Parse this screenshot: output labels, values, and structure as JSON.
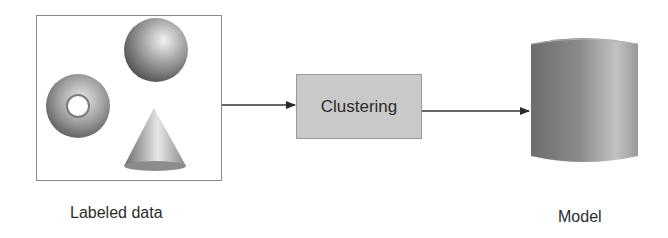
{
  "diagram": {
    "input": {
      "label": "Labeled data",
      "shapes": [
        "torus",
        "sphere",
        "cone"
      ]
    },
    "process": {
      "label": "Clustering"
    },
    "output": {
      "label": "Model",
      "shape": "cylinder"
    },
    "edges": [
      {
        "from": "Labeled data",
        "to": "Clustering"
      },
      {
        "from": "Clustering",
        "to": "Model"
      }
    ],
    "colors": {
      "process_fill": "#c9c9c9",
      "line": "#333333",
      "border": "#8a8a8a"
    }
  }
}
